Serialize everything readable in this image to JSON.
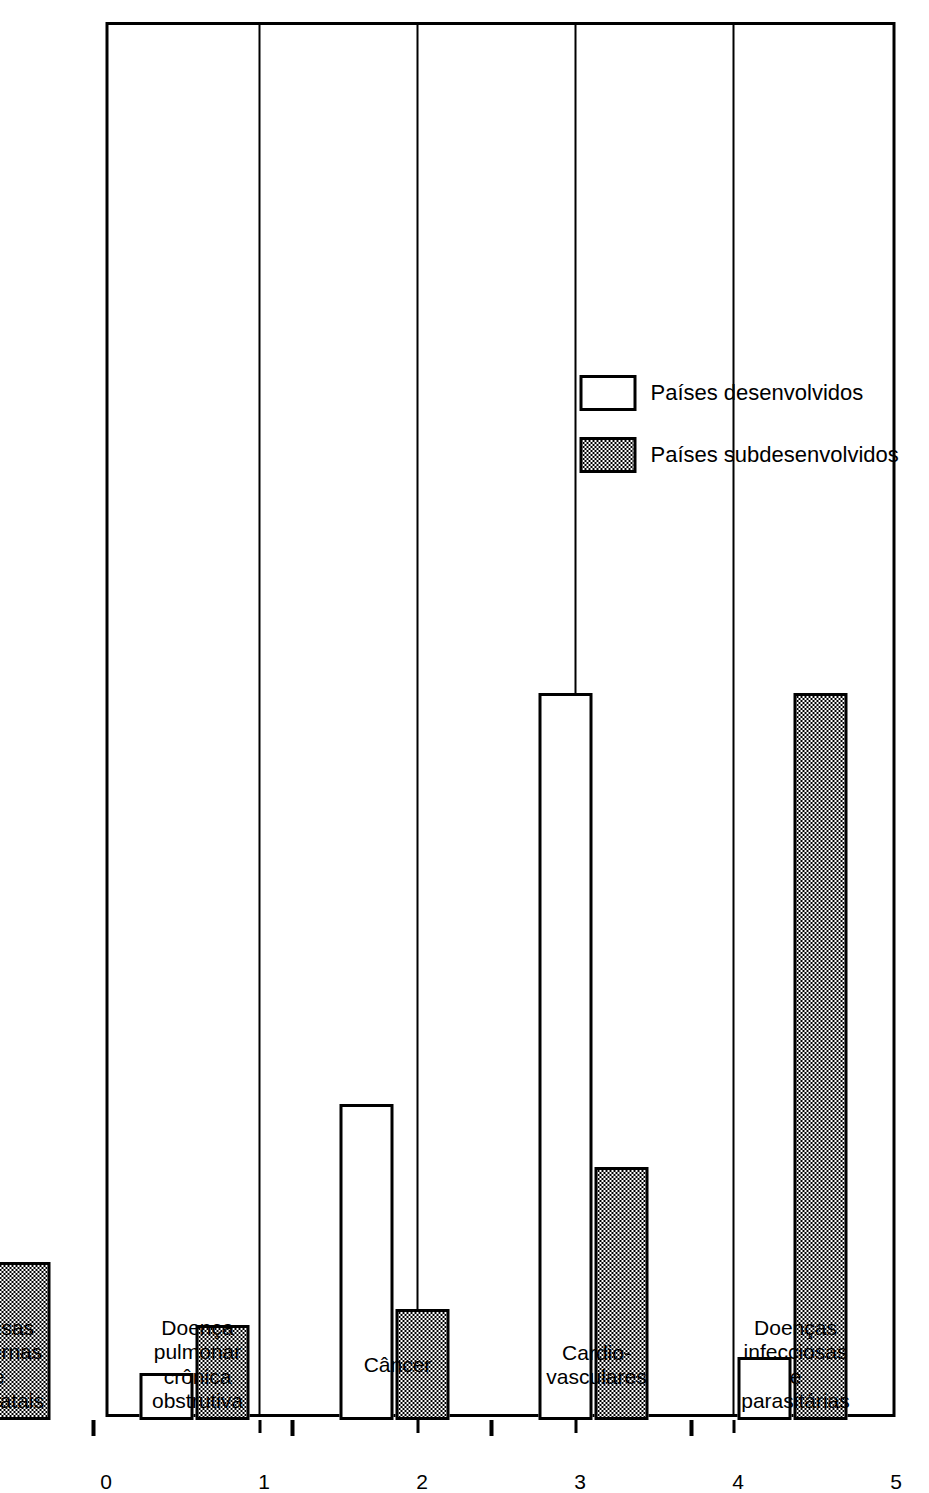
{
  "chart_data": {
    "type": "bar",
    "orientation": "horizontal",
    "title": "",
    "xlabel": "",
    "ylabel": "",
    "xlim": [
      0,
      5
    ],
    "xticks": [
      "0",
      "1",
      "2",
      "3",
      "4",
      "5"
    ],
    "grid": true,
    "legend_position": "upper-left",
    "categories": [
      "Doenças\ninfecciosas\ne parasitárias",
      "Cardio-\nvasculares",
      "Câncer",
      "Doença\npulmonar\ncrônica\nobstrutiva",
      "Causas\nmaternas\ne\nperinatais",
      "Acidentes\ne\nviolências",
      "Outras\ncausas e\ncausas\ndesconhecidas"
    ],
    "series": [
      {
        "name": "Países desenvolvidos",
        "fill": "hollow",
        "values": [
          0.4,
          4.6,
          2.0,
          0.3,
          0.1,
          0.7,
          1.3
        ]
      },
      {
        "name": "Países subdesenvolvidos",
        "fill": "stippled",
        "values": [
          4.6,
          1.6,
          0.7,
          0.6,
          1.0,
          0.7,
          1.1
        ]
      }
    ]
  },
  "legend": {
    "items": [
      {
        "label": "Países desenvolvidos",
        "fill": "hollow"
      },
      {
        "label": "Países subdesenvolvidos",
        "fill": "stippled"
      }
    ]
  },
  "axis": {
    "ticks": [
      {
        "label": "5",
        "value": 5
      },
      {
        "label": "4",
        "value": 4
      },
      {
        "label": "3",
        "value": 3
      },
      {
        "label": "2",
        "value": 2
      },
      {
        "label": "1",
        "value": 1
      },
      {
        "label": "0",
        "value": 0
      }
    ]
  },
  "colors": {
    "ink": "#000000",
    "paper": "#ffffff"
  }
}
